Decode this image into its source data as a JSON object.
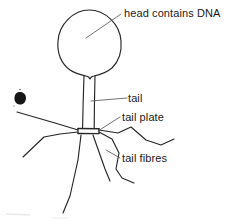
{
  "figure": {
    "background_color": "#ffffff",
    "ink_color": "#262626",
    "labels": {
      "head": "head contains DNA",
      "tail": "tail",
      "tail_plate": "tail plate",
      "tail_fibres": "tail fibres"
    },
    "parts": {
      "head": "phage-head",
      "tail": "phage-tail",
      "tail_plate": "phage-tail-plate",
      "tail_fibres": "phage-tail-fibres",
      "ink_blot": "ink-blot-smudge"
    }
  }
}
